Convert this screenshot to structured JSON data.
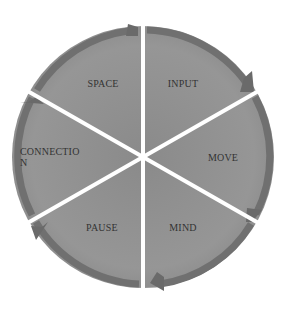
{
  "diagram": {
    "type": "cycle",
    "segments": [
      {
        "id": "input",
        "label": "INPUT"
      },
      {
        "id": "move",
        "label": "MOVE"
      },
      {
        "id": "mind",
        "label": "MIND"
      },
      {
        "id": "pause",
        "label": "PAUSE"
      },
      {
        "id": "connection",
        "label_line1": "CONNECTIO",
        "label_line2": "N"
      },
      {
        "id": "space",
        "label": "SPACE"
      }
    ],
    "colors": {
      "segment_fill": "#8c8c8c",
      "segment_inner": "#959595",
      "arrow": "#6e6e6e",
      "divider": "#ffffff"
    }
  }
}
